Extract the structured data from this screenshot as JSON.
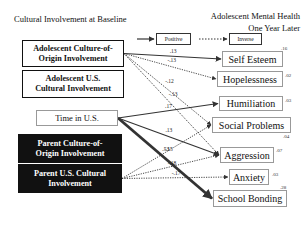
{
  "titles": {
    "left": "Cultural Involvement at Baseline",
    "right_line1": "Adolescent Mental Health",
    "right_line2": "One Year Later"
  },
  "legend": {
    "positive": "Positive",
    "inverse": "Inverse"
  },
  "predictors": [
    {
      "id": "adol_coo",
      "line1": "Adolescent Culture-of-",
      "line2": "Origin Involvement",
      "style": "white"
    },
    {
      "id": "adol_us",
      "line1": "Adolescent U.S.",
      "line2": "Cultural Involvement",
      "style": "white"
    },
    {
      "id": "time_us",
      "line1": "Time in U.S.",
      "line2": "",
      "style": "plain"
    },
    {
      "id": "par_coo",
      "line1": "Parent Culture-of-",
      "line2": "Origin Involvement",
      "style": "black"
    },
    {
      "id": "par_us",
      "line1": "Parent U.S. Cultural",
      "line2": "Involvement",
      "style": "black"
    }
  ],
  "outcomes": [
    {
      "id": "self_esteem",
      "label": "Self Esteem",
      "r2": ".16"
    },
    {
      "id": "hopelessness",
      "label": "Hopelessness",
      "r2": ".02"
    },
    {
      "id": "humiliation",
      "label": "Humiliation",
      "r2": ".03"
    },
    {
      "id": "social_problems",
      "label": "Social Problems",
      "r2": ".04"
    },
    {
      "id": "aggression",
      "label": "Aggression",
      "r2": ".07"
    },
    {
      "id": "anxiety",
      "label": "Anxiety",
      "r2": ".03"
    },
    {
      "id": "school_bonding",
      "label": "School Bonding",
      "r2": ".28"
    }
  ],
  "paths": [
    {
      "from": "adol_coo",
      "to": "self_esteem",
      "coef": ".13",
      "type": "positive"
    },
    {
      "from": "adol_coo",
      "to": "hopelessness",
      "coef": "-.13",
      "type": "inverse"
    },
    {
      "from": "adol_coo",
      "to": "social_problems",
      "coef": "-.12",
      "type": "inverse"
    },
    {
      "from": "adol_coo",
      "to": "aggression",
      "coef": "-.13",
      "type": "inverse"
    },
    {
      "from": "time_us",
      "to": "humiliation",
      "coef": ".17",
      "type": "positive"
    },
    {
      "from": "time_us",
      "to": "aggression",
      "coef": ".13",
      "type": "positive"
    },
    {
      "from": "time_us",
      "to": "school_bonding",
      "coef": ".53",
      "type": "positive"
    },
    {
      "from": "par_us",
      "to": "social_problems",
      "coef": "-.15",
      "type": "inverse"
    },
    {
      "from": "par_us",
      "to": "aggression",
      "coef": "-.18",
      "type": "inverse"
    },
    {
      "from": "par_us",
      "to": "anxiety",
      "coef": "-.17",
      "type": "inverse"
    }
  ]
}
